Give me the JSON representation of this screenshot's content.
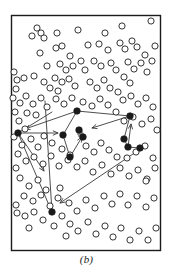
{
  "figure": {
    "caption": "(b)",
    "label": "scatter-plot-with-movement-vectors",
    "canvas": {
      "width": 173,
      "height": 272
    },
    "frame": {
      "x": 11,
      "y": 15,
      "width": 149,
      "height": 235,
      "stroke": "#1b1b1b",
      "stroke_width": 1.4
    },
    "colors": {
      "background": "#ffffff",
      "frame": "#1b1b1b",
      "open_marker_stroke": "#2a2a2a",
      "filled_marker": "#1a1a1a",
      "gray_marker": "#8c8c8c",
      "arrow": "#3a3a3a",
      "caption": "#1b1b1b"
    },
    "marker_radius": {
      "open": 3.1,
      "filled": 3.3,
      "gray": 2.8
    }
  },
  "chart_data": {
    "type": "scatter",
    "title": "",
    "subtitle": "",
    "xlabel": "",
    "ylabel": "",
    "xlim": [
      11,
      160
    ],
    "ylim": [
      15,
      250
    ],
    "grid": false,
    "legend": null,
    "annotations": [
      {
        "text": "(b)",
        "position": "below-axes",
        "style": "italic"
      }
    ],
    "series": [
      {
        "name": "unselected-points",
        "marker": "open-circle",
        "count": 118,
        "points": [
          [
            37,
            28
          ],
          [
            41,
            33
          ],
          [
            32,
            36
          ],
          [
            44,
            38
          ],
          [
            57,
            33
          ],
          [
            78,
            30
          ],
          [
            105,
            33
          ],
          [
            122,
            26
          ],
          [
            151,
            21
          ],
          [
            99,
            44
          ],
          [
            120,
            43
          ],
          [
            125,
            49
          ],
          [
            56,
            48
          ],
          [
            62,
            46
          ],
          [
            88,
            45
          ],
          [
            108,
            50
          ],
          [
            40,
            53
          ],
          [
            70,
            56
          ],
          [
            81,
            61
          ],
          [
            94,
            61
          ],
          [
            132,
            41
          ],
          [
            137,
            47
          ],
          [
            145,
            55
          ],
          [
            155,
            46
          ],
          [
            47,
            66
          ],
          [
            60,
            64
          ],
          [
            66,
            70
          ],
          [
            73,
            66
          ],
          [
            85,
            70
          ],
          [
            101,
            66
          ],
          [
            111,
            63
          ],
          [
            116,
            70
          ],
          [
            14,
            72
          ],
          [
            17,
            80
          ],
          [
            16,
            89
          ],
          [
            24,
            78
          ],
          [
            34,
            76
          ],
          [
            44,
            82
          ],
          [
            128,
            62
          ],
          [
            134,
            69
          ],
          [
            141,
            63
          ],
          [
            147,
            72
          ],
          [
            152,
            61
          ],
          [
            124,
            77
          ],
          [
            130,
            83
          ],
          [
            55,
            78
          ],
          [
            62,
            82
          ],
          [
            69,
            79
          ],
          [
            50,
            88
          ],
          [
            58,
            91
          ],
          [
            75,
            86
          ],
          [
            90,
            82
          ],
          [
            97,
            88
          ],
          [
            104,
            80
          ],
          [
            110,
            88
          ],
          [
            118,
            92
          ],
          [
            13,
            98
          ],
          [
            20,
            103
          ],
          [
            15,
            112
          ],
          [
            26,
            96
          ],
          [
            33,
            104
          ],
          [
            41,
            98
          ],
          [
            47,
            107
          ],
          [
            36,
            115
          ],
          [
            27,
            113
          ],
          [
            56,
            99
          ],
          [
            64,
            104
          ],
          [
            72,
            98
          ],
          [
            83,
            102
          ],
          [
            92,
            106
          ],
          [
            100,
            99
          ],
          [
            108,
            105
          ],
          [
            123,
            100
          ],
          [
            131,
            96
          ],
          [
            138,
            104
          ],
          [
            146,
            98
          ],
          [
            153,
            107
          ],
          [
            116,
            112
          ],
          [
            124,
            121
          ],
          [
            133,
            117
          ],
          [
            142,
            124
          ],
          [
            151,
            119
          ],
          [
            157,
            130
          ],
          [
            19,
            121
          ],
          [
            25,
            129
          ],
          [
            14,
            137
          ],
          [
            22,
            145
          ],
          [
            31,
            139
          ],
          [
            38,
            147
          ],
          [
            44,
            136
          ],
          [
            52,
            143
          ],
          [
            62,
            149
          ],
          [
            70,
            155
          ],
          [
            86,
            146
          ],
          [
            94,
            152
          ],
          [
            101,
            143
          ],
          [
            109,
            150
          ],
          [
            117,
            157
          ],
          [
            127,
            158
          ],
          [
            136,
            152
          ],
          [
            145,
            146
          ],
          [
            153,
            158
          ],
          [
            18,
            154
          ],
          [
            26,
            161
          ],
          [
            34,
            157
          ],
          [
            43,
            164
          ],
          [
            51,
            156
          ],
          [
            59,
            166
          ],
          [
            68,
            160
          ],
          [
            77,
            167
          ],
          [
            85,
            161
          ],
          [
            93,
            172
          ],
          [
            102,
            165
          ],
          [
            111,
            174
          ],
          [
            120,
            168
          ],
          [
            129,
            176
          ],
          [
            138,
            170
          ],
          [
            147,
            179
          ],
          [
            155,
            168
          ],
          [
            16,
            168
          ]
        ]
      },
      {
        "name": "unselected-points-lower",
        "marker": "open-circle",
        "count": 42,
        "points": [
          [
            20,
            178
          ],
          [
            29,
            186
          ],
          [
            38,
            180
          ],
          [
            46,
            190
          ],
          [
            24,
            196
          ],
          [
            33,
            201
          ],
          [
            41,
            195
          ],
          [
            16,
            205
          ],
          [
            50,
            206
          ],
          [
            58,
            198
          ],
          [
            17,
            213
          ],
          [
            25,
            216
          ],
          [
            34,
            212
          ],
          [
            43,
            220
          ],
          [
            29,
            228
          ],
          [
            54,
            226
          ],
          [
            62,
            216
          ],
          [
            70,
            224
          ],
          [
            66,
            236
          ],
          [
            78,
            231
          ],
          [
            88,
            222
          ],
          [
            96,
            234
          ],
          [
            105,
            226
          ],
          [
            113,
            237
          ],
          [
            121,
            228
          ],
          [
            130,
            240
          ],
          [
            139,
            231
          ],
          [
            148,
            240
          ],
          [
            156,
            228
          ],
          [
            104,
            196
          ],
          [
            112,
            204
          ],
          [
            120,
            194
          ],
          [
            128,
            205
          ],
          [
            137,
            196
          ],
          [
            146,
            207
          ],
          [
            154,
            198
          ],
          [
            95,
            208
          ],
          [
            86,
            200
          ],
          [
            77,
            211
          ],
          [
            69,
            203
          ],
          [
            60,
            188
          ],
          [
            146,
            181
          ]
        ]
      },
      {
        "name": "selected-points",
        "marker": "filled-circle",
        "count": 9,
        "points": [
          [
            18,
            133
          ],
          [
            77,
            111
          ],
          [
            63,
            135
          ],
          [
            79,
            130
          ],
          [
            83,
            137
          ],
          [
            70,
            157
          ],
          [
            130,
            116
          ],
          [
            124,
            139
          ],
          [
            128,
            147
          ],
          [
            140,
            148
          ],
          [
            52,
            212
          ]
        ]
      },
      {
        "name": "intermediate-points",
        "marker": "gray-filled-circle",
        "count": 2,
        "points": [
          [
            80,
            133
          ],
          [
            81,
            135
          ]
        ]
      }
    ],
    "vectors": [
      {
        "name": "top-to-left",
        "from": [
          77,
          111
        ],
        "to": [
          25,
          129
        ],
        "arrow": "end"
      },
      {
        "name": "left-spur-up",
        "from": [
          18,
          133
        ],
        "to": [
          52,
          112
        ],
        "arrow": "none"
      },
      {
        "name": "left-to-center",
        "from": [
          18,
          133
        ],
        "to": [
          58,
          133
        ],
        "arrow": "end"
      },
      {
        "name": "left-to-lower",
        "from": [
          18,
          133
        ],
        "to": [
          44,
          171
        ],
        "arrow": "end"
      },
      {
        "name": "center-to-top",
        "from": [
          63,
          135
        ],
        "to": [
          77,
          111
        ],
        "arrow": "none"
      },
      {
        "name": "center-to-lower",
        "from": [
          63,
          135
        ],
        "to": [
          70,
          157
        ],
        "arrow": "none"
      },
      {
        "name": "lower-to-mid",
        "from": [
          70,
          157
        ],
        "to": [
          82,
          137
        ],
        "arrow": "end"
      },
      {
        "name": "top-to-right",
        "from": [
          77,
          111
        ],
        "to": [
          130,
          116
        ],
        "arrow": "none"
      },
      {
        "name": "right-inbound",
        "from": [
          130,
          116
        ],
        "to": [
          92,
          128
        ],
        "arrow": "end"
      },
      {
        "name": "right-down",
        "from": [
          130,
          116
        ],
        "to": [
          124,
          139
        ],
        "arrow": "none"
      },
      {
        "name": "right-cluster-up",
        "from": [
          128,
          147
        ],
        "to": [
          131,
          124
        ],
        "arrow": "end"
      },
      {
        "name": "right-cluster-link",
        "from": [
          124,
          139
        ],
        "to": [
          128,
          147
        ],
        "arrow": "none"
      },
      {
        "name": "right-cluster-link-2",
        "from": [
          128,
          147
        ],
        "to": [
          140,
          148
        ],
        "arrow": "none"
      },
      {
        "name": "right-to-bottom",
        "from": [
          136,
          152
        ],
        "to": [
          60,
          203
        ],
        "arrow": "end"
      },
      {
        "name": "bottom-up-long",
        "from": [
          52,
          212
        ],
        "to": [
          45,
          101
        ],
        "arrow": "none"
      },
      {
        "name": "bottom-to-left",
        "from": [
          52,
          212
        ],
        "to": [
          18,
          133
        ],
        "arrow": "none"
      }
    ]
  }
}
